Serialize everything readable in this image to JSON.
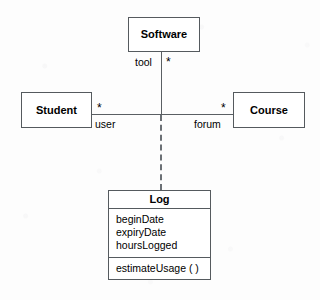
{
  "diagram": {
    "type": "uml-class-diagram",
    "notation": "ternary association with association class",
    "background_color": "#fdfdfd",
    "line_color": "#5a5f63",
    "border_color": "#555a5e",
    "text_color": "#000000"
  },
  "classes": {
    "software": {
      "name": "Software"
    },
    "student": {
      "name": "Student"
    },
    "course": {
      "name": "Course"
    },
    "log": {
      "name": "Log",
      "attributes": [
        "beginDate",
        "expiryDate",
        "hoursLogged"
      ],
      "operations": [
        "estimateUsage ( )"
      ]
    }
  },
  "association": {
    "roles": {
      "tool": "tool",
      "user": "user",
      "forum": "forum"
    },
    "multiplicities": {
      "software_end": "*",
      "student_end": "*",
      "course_end": "*"
    }
  }
}
